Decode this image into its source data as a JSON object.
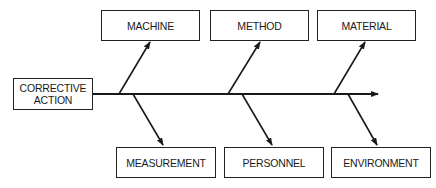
{
  "diagram": {
    "type": "fishbone",
    "effect": {
      "label_line1": "CORRECTIVE",
      "label_line2": "ACTION"
    },
    "causes_top": [
      {
        "label": "MACHINE"
      },
      {
        "label": "METHOD"
      },
      {
        "label": "MATERIAL"
      }
    ],
    "causes_bottom": [
      {
        "label": "MEASUREMENT"
      },
      {
        "label": "PERSONNEL"
      },
      {
        "label": "ENVIRONMENT"
      }
    ],
    "colors": {
      "line": "#1a1a1a",
      "background": "#ffffff"
    }
  }
}
